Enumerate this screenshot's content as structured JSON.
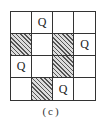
{
  "diagram": {
    "type": "4x4 board (queens placement)",
    "rows": 4,
    "cols": 4,
    "cells": [
      [
        "",
        "Q",
        "",
        ""
      ],
      [
        "#",
        "",
        "#",
        "Q"
      ],
      [
        "Q",
        "",
        "#",
        ""
      ],
      [
        "",
        "#",
        "Q",
        ""
      ]
    ],
    "legend": {
      "Q": "queen",
      "#": "hatched (blocked) cell"
    },
    "caption": "(c)"
  }
}
